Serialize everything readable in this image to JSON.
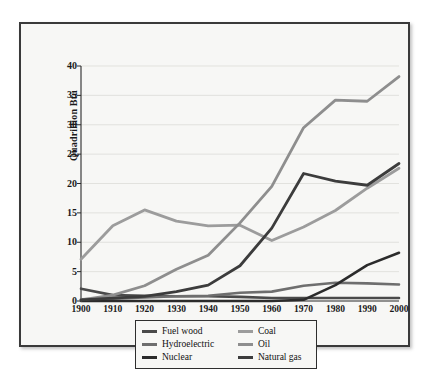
{
  "figure": {
    "background_color": "#ffffff",
    "plate_background": "#f7f7f5",
    "frame_color": "#3a3a3a"
  },
  "chart_data": {
    "type": "line",
    "title": "",
    "subtitle": "",
    "xlabel": "",
    "ylabel": "Quadrillion Btu",
    "x": [
      1900,
      1910,
      1920,
      1930,
      1940,
      1950,
      1960,
      1970,
      1980,
      1990,
      2000
    ],
    "xtick_labels": [
      "1900",
      "1910",
      "1920",
      "1930",
      "1940",
      "1950",
      "1960",
      "1970",
      "1980",
      "1990",
      "2000"
    ],
    "ytick_labels": [
      "0",
      "5",
      "10",
      "15",
      "20",
      "25",
      "30",
      "35",
      "40"
    ],
    "yticks": [
      0,
      5,
      10,
      15,
      20,
      25,
      30,
      35,
      40
    ],
    "xlim": [
      1900,
      2000
    ],
    "ylim": [
      0,
      40
    ],
    "grid": true,
    "grid_axis": "y",
    "grid_color": "#d8d8d4",
    "legend_position": "below-axes",
    "series": [
      {
        "name": "Fuel wood",
        "color": "#4a4a4a",
        "width": 2.6,
        "values": [
          2.1,
          1.0,
          0.9,
          0.8,
          0.8,
          0.7,
          0.5,
          0.5,
          0.5,
          0.5,
          0.5
        ]
      },
      {
        "name": "Hydroelectric",
        "color": "#6e6e6e",
        "width": 2.6,
        "values": [
          0.3,
          0.4,
          0.6,
          0.8,
          0.9,
          1.4,
          1.6,
          2.6,
          3.1,
          3.0,
          2.8
        ]
      },
      {
        "name": "Nuclear",
        "color": "#2b2b2b",
        "width": 2.6,
        "values": [
          0,
          0,
          0,
          0,
          0,
          0,
          0,
          0.2,
          2.7,
          6.1,
          8.2
        ]
      },
      {
        "name": "Coal",
        "color": "#9c9c9c",
        "width": 2.8,
        "values": [
          7.1,
          12.8,
          15.5,
          13.6,
          12.8,
          12.9,
          10.3,
          12.6,
          15.4,
          19.2,
          22.6
        ]
      },
      {
        "name": "Oil",
        "color": "#8e8e8e",
        "width": 2.8,
        "values": [
          0.2,
          1.0,
          2.6,
          5.4,
          7.8,
          13.3,
          19.5,
          29.5,
          34.2,
          34.0,
          38.2
        ]
      },
      {
        "name": "Natural gas",
        "color": "#3c3c3c",
        "width": 2.8,
        "values": [
          0.2,
          0.5,
          0.8,
          1.6,
          2.7,
          6.0,
          12.4,
          21.7,
          20.4,
          19.7,
          23.4
        ]
      }
    ]
  },
  "axes": {
    "y_title": "Quadrillion Btu"
  },
  "legend": {
    "rows": [
      {
        "left": {
          "label": "Fuel wood",
          "color": "#4a4a4a"
        },
        "right": {
          "label": "Coal",
          "color": "#9c9c9c"
        }
      },
      {
        "left": {
          "label": "Hydroelectric",
          "color": "#6e6e6e"
        },
        "right": {
          "label": "Oil",
          "color": "#8e8e8e"
        }
      },
      {
        "left": {
          "label": "Nuclear",
          "color": "#2b2b2b"
        },
        "right": {
          "label": "Natural gas",
          "color": "#3c3c3c"
        }
      }
    ]
  }
}
